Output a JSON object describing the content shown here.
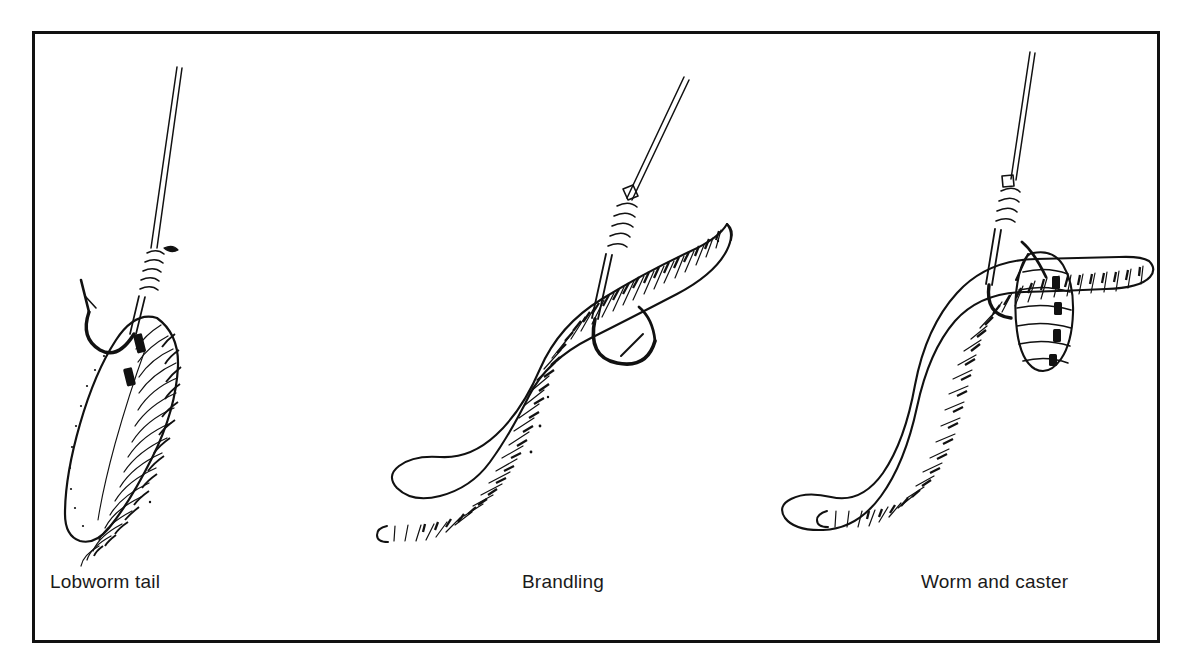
{
  "figure": {
    "background_color": "#ffffff",
    "ink_color": "#111111",
    "border_color": "#111111",
    "caption_color": "#1a1a1a",
    "panel_count": 3
  },
  "panels": [
    {
      "id": "lobworm-tail",
      "caption": "Lobworm tail",
      "subject": "lobworm-tail-on-hook",
      "description": "Segmented lobworm tail section threaded on a whipped spade-end hook hanging from line",
      "caption_x": 47,
      "caption_y": 580,
      "elements": [
        "fishing-line",
        "whipping-knot",
        "hook-shank",
        "hook-bend",
        "hook-point",
        "hook-barb",
        "worm-tail-body",
        "worm-segment-rings"
      ]
    },
    {
      "id": "brandling",
      "caption": "Brandling",
      "subject": "brandling-worm-on-hook",
      "description": "Whole brandling worm hooked once through the head, body hanging in an S-curve",
      "caption_x": 487,
      "caption_y": 580,
      "elements": [
        "fishing-line",
        "hook-eye",
        "whipping-knot",
        "hook-shank",
        "hook-bend",
        "hook-point",
        "hook-barb",
        "worm-body",
        "worm-segment-rings",
        "worm-tail-tip"
      ]
    },
    {
      "id": "worm-and-caster",
      "caption": "Worm and caster",
      "subject": "worm-and-caster-cocktail-on-hook",
      "description": "Worm and a caster pupa mounted together on one hook as a cocktail bait",
      "caption_x": 888,
      "caption_y": 580,
      "elements": [
        "fishing-line",
        "hook-eye",
        "whipping-knot",
        "hook-shank",
        "hook-bend",
        "hook-point",
        "hook-barb",
        "worm-body",
        "worm-segment-rings",
        "caster-pupa",
        "caster-segment-rings"
      ]
    }
  ]
}
